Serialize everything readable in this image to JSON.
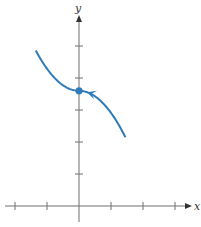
{
  "chart_data": {
    "type": "line",
    "title": "",
    "xlabel": "x",
    "ylabel": "y",
    "xlim": [
      -2,
      3
    ],
    "ylim": [
      -0.5,
      6
    ],
    "grid": false,
    "legend": null,
    "x_ticks": [
      -2,
      -1,
      0,
      1,
      2,
      3
    ],
    "y_ticks": [
      1,
      2,
      3,
      4,
      5
    ],
    "tick_labels_shown": false,
    "series": [
      {
        "name": "parametric curve",
        "color": "#2f7ab8",
        "x": [
          1.45,
          1.2,
          0.9,
          0.6,
          0.3,
          0.0,
          -0.3,
          -0.6,
          -0.9,
          -1.2,
          -1.35
        ],
        "y": [
          2.6,
          2.85,
          3.04,
          3.35,
          3.54,
          3.6,
          3.66,
          3.85,
          4.16,
          4.4,
          4.55
        ],
        "direction": "right-to-left (arrow pointing up-left)"
      }
    ],
    "annotations": [
      {
        "type": "point",
        "x": 0,
        "y": 3.6,
        "label": ""
      },
      {
        "type": "direction-arrow",
        "x": 0.25,
        "y": 3.4,
        "points": "up-left along curve"
      }
    ]
  },
  "labels": {
    "x_axis": "x",
    "y_axis": "y"
  },
  "colors": {
    "curve": "#2f7ab8",
    "axes": "#6e6e6e"
  }
}
